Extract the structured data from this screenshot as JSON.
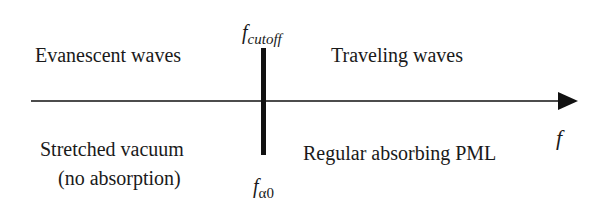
{
  "diagram": {
    "axis": {
      "label": "f",
      "direction": "right"
    },
    "divider": {
      "top_label": {
        "base": "f",
        "subscript": "cutoff"
      },
      "bottom_label": {
        "base": "f",
        "subscript": "α0"
      }
    },
    "regions": {
      "upper_left": "Evanescent waves",
      "upper_right": "Traveling waves",
      "lower_left_line1": "Stretched vacuum",
      "lower_left_line2": "(no absorption)",
      "lower_right": "Regular absorbing PML"
    },
    "colors": {
      "line": "#111111",
      "text": "#1a1a1a",
      "background": "#ffffff"
    }
  }
}
